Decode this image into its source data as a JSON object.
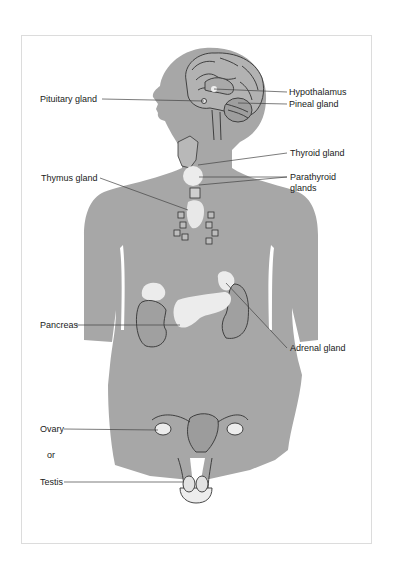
{
  "diagram": {
    "colors": {
      "body": "#a7a7a7",
      "gland": "#ececec",
      "outline": "#333333",
      "leader": "#444444",
      "frame_border": "#dcdcdc"
    },
    "labels": {
      "pituitary": "Pituitary gland",
      "hypothalamus": "Hypothalamus",
      "pineal": "Pineal gland",
      "thyroid": "Thyroid gland",
      "thymus": "Thymus gland",
      "parathyroid_line1": "Parathyroid",
      "parathyroid_line2": "glands",
      "pancreas": "Pancreas",
      "adrenal": "Adrenal gland",
      "ovary": "Ovary",
      "or": "or",
      "testis": "Testis"
    }
  }
}
